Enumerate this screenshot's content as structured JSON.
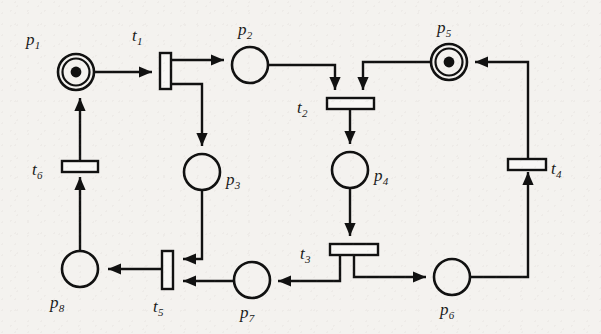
{
  "figure": {
    "type": "petri-net",
    "background_color": "#f4f2ef",
    "ink_color": "#111111",
    "width": 601,
    "height": 334
  },
  "places": [
    {
      "id": "p1",
      "label": "p",
      "subscript": "1",
      "cx": 76,
      "cy": 72,
      "r": 18,
      "tokens": 1,
      "label_x": 26,
      "label_y": 30
    },
    {
      "id": "p2",
      "label": "p",
      "subscript": "2",
      "cx": 250,
      "cy": 65,
      "r": 18,
      "tokens": 0,
      "label_x": 238,
      "label_y": 20
    },
    {
      "id": "p3",
      "label": "p",
      "subscript": "3",
      "cx": 202,
      "cy": 172,
      "r": 18,
      "tokens": 0,
      "label_x": 226,
      "label_y": 170
    },
    {
      "id": "p4",
      "label": "p",
      "subscript": "4",
      "cx": 350,
      "cy": 170,
      "r": 18,
      "tokens": 0,
      "label_x": 374,
      "label_y": 166
    },
    {
      "id": "p5",
      "label": "p",
      "subscript": "5",
      "cx": 449,
      "cy": 62,
      "r": 18,
      "tokens": 1,
      "label_x": 437,
      "label_y": 18
    },
    {
      "id": "p6",
      "label": "p",
      "subscript": "6",
      "cx": 452,
      "cy": 277,
      "r": 18,
      "tokens": 0,
      "label_x": 440,
      "label_y": 300
    },
    {
      "id": "p7",
      "label": "p",
      "subscript": "7",
      "cx": 252,
      "cy": 280,
      "r": 18,
      "tokens": 0,
      "label_x": 240,
      "label_y": 303
    },
    {
      "id": "p8",
      "label": "p",
      "subscript": "8",
      "cx": 80,
      "cy": 269,
      "r": 18,
      "tokens": 0,
      "label_x": 50,
      "label_y": 293
    }
  ],
  "transitions": [
    {
      "id": "t1",
      "label": "t",
      "subscript": "1",
      "x": 160,
      "y": 53,
      "w": 11,
      "h": 36,
      "orientation": "vertical",
      "label_x": 132,
      "label_y": 26
    },
    {
      "id": "t2",
      "label": "t",
      "subscript": "2",
      "x": 327,
      "y": 98,
      "w": 47,
      "h": 11,
      "orientation": "horizontal",
      "label_x": 297,
      "label_y": 98
    },
    {
      "id": "t3",
      "label": "t",
      "subscript": "3",
      "x": 330,
      "y": 244,
      "w": 48,
      "h": 11,
      "orientation": "horizontal",
      "label_x": 300,
      "label_y": 244
    },
    {
      "id": "t4",
      "label": "t",
      "subscript": "4",
      "x": 508,
      "y": 159,
      "w": 38,
      "h": 11,
      "orientation": "horizontal",
      "label_x": 551,
      "label_y": 159
    },
    {
      "id": "t5",
      "label": "t",
      "subscript": "5",
      "x": 162,
      "y": 251,
      "w": 11,
      "h": 38,
      "orientation": "vertical",
      "label_x": 153,
      "label_y": 297
    },
    {
      "id": "t6",
      "label": "t",
      "subscript": "6",
      "x": 62,
      "y": 161,
      "w": 36,
      "h": 11,
      "orientation": "horizontal",
      "label_x": 32,
      "label_y": 160
    }
  ],
  "arcs": [
    {
      "id": "arc-p1-t1",
      "from": "p1",
      "to": "t1",
      "points": "94,72 152,72",
      "arrow_at": "152,72",
      "arrow_dir": "right"
    },
    {
      "id": "arc-t1-p2",
      "from": "t1",
      "to": "p2",
      "points": "171,60 224,60",
      "arrow_at": "224,60",
      "arrow_dir": "right"
    },
    {
      "id": "arc-t1-p3",
      "from": "t1",
      "to": "p3",
      "points": "171,84 202,84 202,146",
      "arrow_at": "202,146",
      "arrow_dir": "down"
    },
    {
      "id": "arc-p2-t2",
      "from": "p2",
      "to": "t2",
      "points": "268,65 335,65 335,90",
      "arrow_at": "335,90",
      "arrow_dir": "down"
    },
    {
      "id": "arc-p5-t2",
      "from": "p5",
      "to": "t2",
      "points": "431,62 363,62 363,90",
      "arrow_at": "363,90",
      "arrow_dir": "down"
    },
    {
      "id": "arc-t2-p4",
      "from": "t2",
      "to": "p4",
      "points": "350,109 350,144",
      "arrow_at": "350,144",
      "arrow_dir": "down"
    },
    {
      "id": "arc-p4-t3",
      "from": "p4",
      "to": "t3",
      "points": "350,188 350,236",
      "arrow_at": "350,236",
      "arrow_dir": "down"
    },
    {
      "id": "arc-t3-p6",
      "from": "t3",
      "to": "p6",
      "points": "354,255 354,277 426,277",
      "arrow_at": "426,277",
      "arrow_dir": "right"
    },
    {
      "id": "arc-t3-p7",
      "from": "t3",
      "to": "p7",
      "points": "340,255 340,281 278,281",
      "arrow_at": "278,281",
      "arrow_dir": "left"
    },
    {
      "id": "arc-p6-t4",
      "from": "p6",
      "to": "t4",
      "points": "470,277 528,277 528,172",
      "arrow_at": "528,172",
      "arrow_dir": "up"
    },
    {
      "id": "arc-t4-p5",
      "from": "t4",
      "to": "p5",
      "points": "528,159 528,62 475,62",
      "arrow_at": "475,62",
      "arrow_dir": "left"
    },
    {
      "id": "arc-p7-t5",
      "from": "p7",
      "to": "t5",
      "points": "234,281 183,281",
      "arrow_at": "183,281",
      "arrow_dir": "left"
    },
    {
      "id": "arc-p3-t5",
      "from": "p3",
      "to": "t5",
      "points": "202,190 202,259 183,259",
      "arrow_at": "183,259",
      "arrow_dir": "left"
    },
    {
      "id": "arc-t5-p8",
      "from": "t5",
      "to": "p8",
      "points": "162,269 108,269",
      "arrow_at": "108,269",
      "arrow_dir": "left"
    },
    {
      "id": "arc-p8-t6",
      "from": "p8",
      "to": "t6",
      "points": "80,251 80,177",
      "arrow_at": "80,177",
      "arrow_dir": "up"
    },
    {
      "id": "arc-t6-p1",
      "from": "t6",
      "to": "p1",
      "points": "80,161 80,98",
      "arrow_at": "80,98",
      "arrow_dir": "up"
    }
  ]
}
